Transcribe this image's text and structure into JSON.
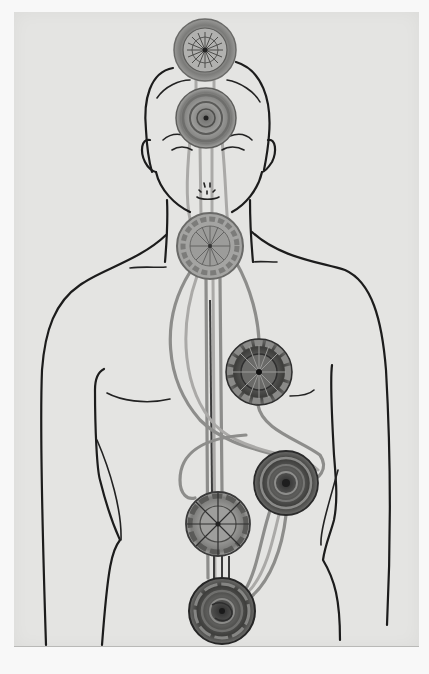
{
  "image": {
    "description": "Vintage grayscale illustration of a human figure (head to pelvis) with seven textured circular discs aligned along the body's vertical axis, connected by streaming channels",
    "palette": {
      "page": "#f8f8f8",
      "plate": "#e4e4e2",
      "line": "#1c1c1c",
      "channel": "#8d8d8b",
      "disc_dark": "#4a4a48",
      "disc_mid": "#8a8a88",
      "disc_light": "#b8b8b6"
    },
    "discs": [
      {
        "name": "crown",
        "cx": 205,
        "cy": 50,
        "r": 31,
        "style": "wheel-petals"
      },
      {
        "name": "brow",
        "cx": 206,
        "cy": 118,
        "r": 30,
        "style": "concentric"
      },
      {
        "name": "throat",
        "cx": 210,
        "cy": 246,
        "r": 33,
        "style": "scalloped-wheel"
      },
      {
        "name": "heart",
        "cx": 259,
        "cy": 372,
        "r": 33,
        "style": "scalloped-dark"
      },
      {
        "name": "solar-plexus",
        "cx": 286,
        "cy": 483,
        "r": 32,
        "style": "concentric-dark"
      },
      {
        "name": "sacral",
        "cx": 218,
        "cy": 524,
        "r": 32,
        "style": "segmented-wheel"
      },
      {
        "name": "root",
        "cx": 222,
        "cy": 611,
        "r": 33,
        "style": "concentric-dark"
      }
    ]
  }
}
